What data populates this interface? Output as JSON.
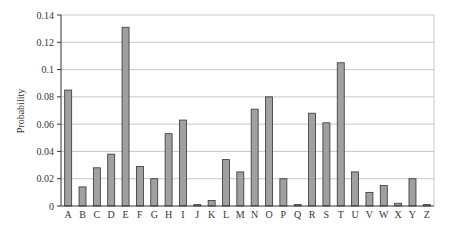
{
  "chart_data": {
    "type": "bar",
    "title": "",
    "xlabel": "",
    "ylabel": "Probability",
    "ylim": [
      0,
      0.14
    ],
    "yticks": [
      "0",
      "0.02",
      "0.04",
      "0.06",
      "0.08",
      "0.1",
      "0.12",
      "0.14"
    ],
    "grid": true,
    "legend": null,
    "categories": [
      "A",
      "B",
      "C",
      "D",
      "E",
      "F",
      "G",
      "H",
      "I",
      "J",
      "K",
      "L",
      "M",
      "N",
      "O",
      "P",
      "Q",
      "R",
      "S",
      "T",
      "U",
      "V",
      "W",
      "X",
      "Y",
      "Z"
    ],
    "values": [
      0.085,
      0.014,
      0.028,
      0.038,
      0.131,
      0.029,
      0.02,
      0.053,
      0.063,
      0.001,
      0.004,
      0.034,
      0.025,
      0.071,
      0.08,
      0.02,
      0.001,
      0.068,
      0.061,
      0.105,
      0.025,
      0.01,
      0.015,
      0.002,
      0.02,
      0.001
    ],
    "colors": {
      "bar_fill": "#a0a0a0",
      "bar_stroke": "#333333",
      "grid": "#c8c8c8",
      "axis": "#333333"
    }
  }
}
